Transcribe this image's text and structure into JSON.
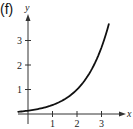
{
  "panel": {
    "label": "(f)"
  },
  "chart_data": {
    "type": "line",
    "title": "",
    "xlabel": "x",
    "ylabel": "y",
    "x_ticks": [
      "1",
      "2",
      "3"
    ],
    "y_ticks": [
      "1",
      "2",
      "3"
    ],
    "xlim": [
      -0.4,
      3.7
    ],
    "ylim": [
      0,
      4.0
    ],
    "grid": false,
    "legend": null,
    "series": [
      {
        "name": "f",
        "x": [
          -0.4,
          0,
          0.5,
          1,
          1.5,
          2,
          2.5,
          3,
          3.3
        ],
        "values": [
          0.09,
          0.14,
          0.22,
          0.37,
          0.61,
          1.0,
          1.65,
          2.72,
          3.67
        ]
      }
    ],
    "colors": {
      "curve": "#111111",
      "axes": "#333333"
    }
  }
}
